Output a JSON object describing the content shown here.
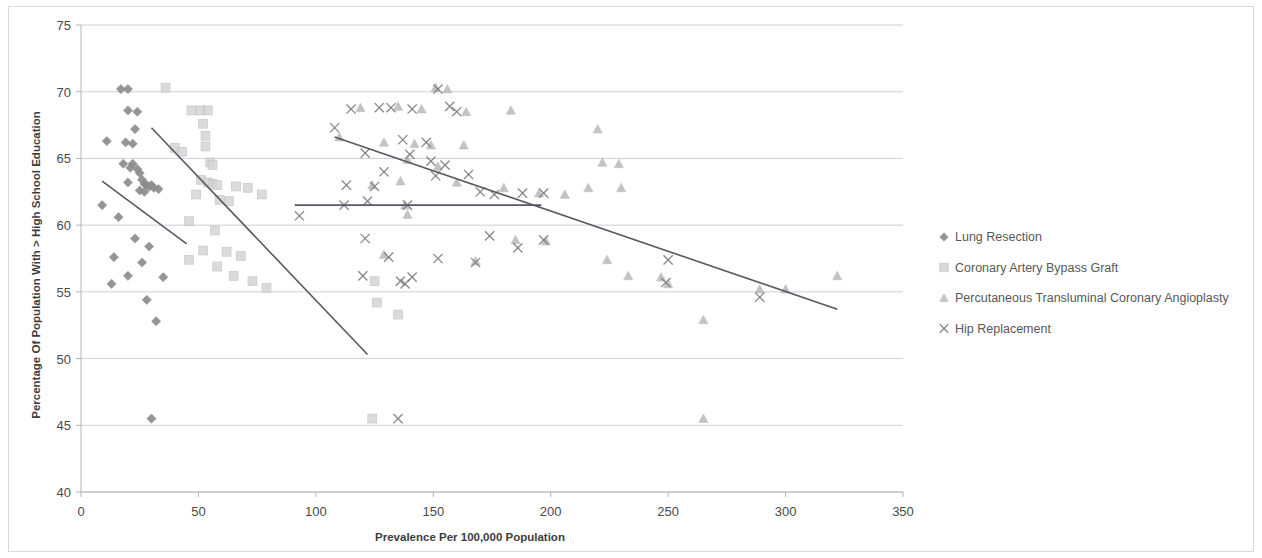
{
  "chart_data": {
    "type": "scatter",
    "title": "",
    "xlabel": "Prevalence Per 100,000 Population",
    "ylabel": "Percentage Of Population With > High School Education",
    "xlim": [
      0,
      350
    ],
    "ylim": [
      40,
      75
    ],
    "xticks": [
      0,
      50,
      100,
      150,
      200,
      250,
      300,
      350
    ],
    "yticks": [
      40,
      45,
      50,
      55,
      60,
      65,
      70,
      75
    ],
    "grid": "horizontal",
    "legend_position": "right",
    "series": [
      {
        "name": "Lung Resection",
        "marker": "diamond",
        "color": "#8d8d8d",
        "points": [
          [
            17,
            70.2
          ],
          [
            20,
            70.2
          ],
          [
            20,
            68.6
          ],
          [
            24,
            68.5
          ],
          [
            23,
            67.2
          ],
          [
            11,
            66.3
          ],
          [
            19,
            66.2
          ],
          [
            22,
            66.1
          ],
          [
            18,
            64.6
          ],
          [
            22,
            64.6
          ],
          [
            21,
            64.3
          ],
          [
            24,
            64.2
          ],
          [
            25,
            63.9
          ],
          [
            26,
            63.4
          ],
          [
            20,
            63.2
          ],
          [
            27,
            63.1
          ],
          [
            28,
            63.0
          ],
          [
            29,
            62.9
          ],
          [
            30,
            63.0
          ],
          [
            31,
            62.8
          ],
          [
            25,
            62.6
          ],
          [
            27,
            62.5
          ],
          [
            33,
            62.7
          ],
          [
            9,
            61.5
          ],
          [
            16,
            60.6
          ],
          [
            14,
            57.6
          ],
          [
            23,
            59.0
          ],
          [
            29,
            58.4
          ],
          [
            26,
            57.2
          ],
          [
            20,
            56.2
          ],
          [
            35,
            56.1
          ],
          [
            13,
            55.6
          ],
          [
            28,
            54.4
          ],
          [
            32,
            52.8
          ],
          [
            30,
            45.5
          ]
        ],
        "trendline": {
          "x1": 9,
          "y1": 63.3,
          "x2": 45,
          "y2": 58.6
        }
      },
      {
        "name": "Coronary Artery Bypass Graft",
        "marker": "square",
        "color": "#d5d5d5",
        "points": [
          [
            36,
            70.3
          ],
          [
            47,
            68.6
          ],
          [
            51,
            68.6
          ],
          [
            54,
            68.6
          ],
          [
            52,
            67.6
          ],
          [
            53,
            66.7
          ],
          [
            53,
            65.9
          ],
          [
            40,
            65.8
          ],
          [
            43,
            65.5
          ],
          [
            55,
            64.7
          ],
          [
            56,
            64.5
          ],
          [
            51,
            63.4
          ],
          [
            54,
            63.2
          ],
          [
            56,
            63.1
          ],
          [
            58,
            63.0
          ],
          [
            66,
            62.9
          ],
          [
            71,
            62.8
          ],
          [
            49,
            62.3
          ],
          [
            59,
            61.9
          ],
          [
            63,
            61.8
          ],
          [
            77,
            62.3
          ],
          [
            46,
            60.3
          ],
          [
            57,
            59.6
          ],
          [
            52,
            58.1
          ],
          [
            62,
            58.0
          ],
          [
            68,
            57.7
          ],
          [
            58,
            56.9
          ],
          [
            65,
            56.2
          ],
          [
            73,
            55.8
          ],
          [
            79,
            55.3
          ],
          [
            46,
            57.4
          ],
          [
            125,
            55.8
          ],
          [
            126,
            54.2
          ],
          [
            135,
            53.3
          ],
          [
            124,
            45.5
          ]
        ],
        "trendline": {
          "x1": 30,
          "y1": 67.3,
          "x2": 122,
          "y2": 50.3
        }
      },
      {
        "name": "Percutaneous Transluminal Coronary Angioplasty",
        "marker": "triangle",
        "color": "#b9b9b9",
        "points": [
          [
            151,
            70.3
          ],
          [
            156,
            70.2
          ],
          [
            119,
            68.8
          ],
          [
            135,
            68.9
          ],
          [
            145,
            68.7
          ],
          [
            164,
            68.5
          ],
          [
            183,
            68.6
          ],
          [
            220,
            67.2
          ],
          [
            110,
            66.6
          ],
          [
            129,
            66.2
          ],
          [
            142,
            66.1
          ],
          [
            149,
            66.0
          ],
          [
            163,
            66.0
          ],
          [
            222,
            64.7
          ],
          [
            229,
            64.6
          ],
          [
            139,
            64.9
          ],
          [
            152,
            64.4
          ],
          [
            136,
            63.3
          ],
          [
            160,
            63.2
          ],
          [
            124,
            63.0
          ],
          [
            180,
            62.8
          ],
          [
            195,
            62.4
          ],
          [
            206,
            62.3
          ],
          [
            216,
            62.8
          ],
          [
            230,
            62.8
          ],
          [
            138,
            61.5
          ],
          [
            139,
            60.8
          ],
          [
            129,
            57.8
          ],
          [
            168,
            57.3
          ],
          [
            185,
            58.9
          ],
          [
            198,
            58.8
          ],
          [
            224,
            57.4
          ],
          [
            233,
            56.2
          ],
          [
            247,
            56.1
          ],
          [
            250,
            55.6
          ],
          [
            289,
            55.2
          ],
          [
            300,
            55.2
          ],
          [
            322,
            56.2
          ],
          [
            265,
            52.9
          ],
          [
            265,
            45.5
          ]
        ],
        "trendline": {
          "x1": 91,
          "y1": 61.5,
          "x2": 196,
          "y2": 61.5
        }
      },
      {
        "name": "Hip Replacement",
        "marker": "cross",
        "color": "#7d7d7d",
        "points": [
          [
            152,
            70.2
          ],
          [
            108,
            67.3
          ],
          [
            115,
            68.7
          ],
          [
            127,
            68.8
          ],
          [
            141,
            68.7
          ],
          [
            132,
            68.8
          ],
          [
            157,
            68.9
          ],
          [
            160,
            68.5
          ],
          [
            137,
            66.4
          ],
          [
            147,
            66.2
          ],
          [
            121,
            65.4
          ],
          [
            140,
            65.3
          ],
          [
            149,
            64.8
          ],
          [
            155,
            64.5
          ],
          [
            129,
            64.0
          ],
          [
            113,
            63.0
          ],
          [
            125,
            62.9
          ],
          [
            151,
            63.7
          ],
          [
            165,
            63.8
          ],
          [
            170,
            62.5
          ],
          [
            176,
            62.3
          ],
          [
            188,
            62.4
          ],
          [
            197,
            62.4
          ],
          [
            112,
            61.5
          ],
          [
            122,
            61.8
          ],
          [
            139,
            61.5
          ],
          [
            93,
            60.7
          ],
          [
            121,
            59.0
          ],
          [
            174,
            59.2
          ],
          [
            186,
            58.3
          ],
          [
            197,
            58.9
          ],
          [
            131,
            57.6
          ],
          [
            152,
            57.5
          ],
          [
            168,
            57.2
          ],
          [
            120,
            56.2
          ],
          [
            141,
            56.1
          ],
          [
            136,
            55.8
          ],
          [
            138,
            55.6
          ],
          [
            250,
            57.4
          ],
          [
            249,
            55.7
          ],
          [
            289,
            54.6
          ],
          [
            135,
            45.5
          ]
        ],
        "trendline": {
          "x1": 108,
          "y1": 66.6,
          "x2": 322,
          "y2": 53.7
        }
      }
    ]
  },
  "legend": {
    "items": [
      {
        "label": "Lung Resection",
        "marker": "diamond"
      },
      {
        "label": "Coronary Artery Bypass Graft",
        "marker": "square"
      },
      {
        "label": "Percutaneous Transluminal Coronary Angioplasty",
        "marker": "triangle"
      },
      {
        "label": "Hip Replacement",
        "marker": "cross"
      }
    ]
  }
}
